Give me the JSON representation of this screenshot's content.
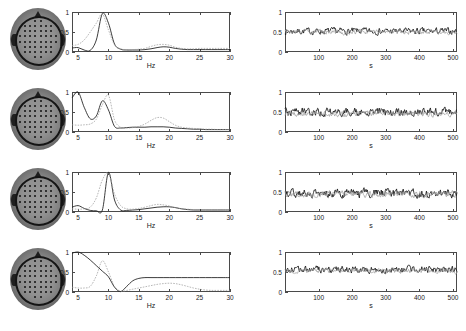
{
  "figure": {
    "rows": 4,
    "colors": {
      "line_primary": "#1a1a1a",
      "line_secondary": "#9a9a9a",
      "axis": "#4a4a4a",
      "head_dark": "#2a2a2a",
      "background": "#ffffff"
    }
  },
  "chart_data": [
    {
      "type": "line",
      "panel": "spectrum",
      "row": 1,
      "title": "",
      "xlabel": "Hz",
      "ylabel": "",
      "xlim": [
        4,
        30
      ],
      "ylim": [
        0,
        1
      ],
      "xticks": [
        5,
        10,
        15,
        20,
        25,
        30
      ],
      "yticks": [
        0,
        0.5,
        1
      ],
      "grid": false,
      "legend": "none",
      "x": [
        4,
        5,
        6,
        7,
        8,
        9,
        10,
        11,
        12,
        13,
        14,
        15,
        16,
        17,
        18,
        19,
        20,
        21,
        22,
        23,
        24,
        25,
        26,
        27,
        28,
        29,
        30
      ],
      "series": [
        {
          "name": "component-spectrum",
          "style": "solid-black",
          "values": [
            0.1,
            0.11,
            0.05,
            0.04,
            0.3,
            0.96,
            0.72,
            0.2,
            0.07,
            0.05,
            0.05,
            0.05,
            0.06,
            0.08,
            0.11,
            0.13,
            0.12,
            0.09,
            0.07,
            0.06,
            0.06,
            0.06,
            0.06,
            0.06,
            0.06,
            0.06,
            0.06
          ]
        },
        {
          "name": "reference-spectrum",
          "style": "dotted-gray",
          "values": [
            0.16,
            0.19,
            0.3,
            0.5,
            0.72,
            0.95,
            0.55,
            0.18,
            0.08,
            0.06,
            0.06,
            0.07,
            0.09,
            0.14,
            0.18,
            0.19,
            0.17,
            0.12,
            0.09,
            0.08,
            0.08,
            0.09,
            0.09,
            0.09,
            0.09,
            0.09,
            0.09
          ]
        }
      ]
    },
    {
      "type": "line",
      "panel": "timecourse",
      "row": 1,
      "title": "",
      "xlabel": "s",
      "ylabel": "",
      "xlim": [
        0,
        512
      ],
      "ylim": [
        0,
        1
      ],
      "xticks": [
        100,
        200,
        300,
        400,
        500
      ],
      "yticks": [
        0,
        0.5,
        1
      ],
      "grid": false,
      "legend": "none",
      "series": [
        {
          "name": "component-activity",
          "style": "solid-black",
          "mean": 0.52,
          "noise_amplitude": 0.09,
          "n_points": 512
        },
        {
          "name": "reference-activity",
          "style": "dotted-gray",
          "mean": 0.5,
          "noise_amplitude": 0.07,
          "n_points": 512
        }
      ]
    },
    {
      "type": "line",
      "panel": "spectrum",
      "row": 2,
      "title": "",
      "xlabel": "Hz",
      "ylabel": "",
      "xlim": [
        4,
        30
      ],
      "ylim": [
        0,
        1
      ],
      "xticks": [
        5,
        10,
        15,
        20,
        25,
        30
      ],
      "yticks": [
        0,
        0.5,
        1
      ],
      "grid": false,
      "legend": "none",
      "x": [
        4,
        5,
        6,
        7,
        8,
        9,
        10,
        11,
        12,
        13,
        14,
        15,
        16,
        17,
        18,
        19,
        20,
        21,
        22,
        23,
        24,
        25,
        26,
        27,
        28,
        29,
        30
      ],
      "series": [
        {
          "name": "component-spectrum",
          "style": "solid-black",
          "values": [
            0.85,
            1.0,
            0.62,
            0.33,
            0.4,
            0.78,
            0.55,
            0.14,
            0.1,
            0.11,
            0.12,
            0.12,
            0.12,
            0.13,
            0.13,
            0.13,
            0.12,
            0.1,
            0.09,
            0.08,
            0.07,
            0.07,
            0.06,
            0.06,
            0.06,
            0.06,
            0.06
          ]
        },
        {
          "name": "reference-spectrum",
          "style": "dotted-gray",
          "values": [
            0.18,
            0.17,
            0.18,
            0.2,
            0.32,
            0.68,
            0.92,
            0.3,
            0.12,
            0.1,
            0.11,
            0.14,
            0.2,
            0.29,
            0.36,
            0.35,
            0.26,
            0.17,
            0.12,
            0.1,
            0.09,
            0.08,
            0.07,
            0.07,
            0.06,
            0.06,
            0.06
          ]
        }
      ]
    },
    {
      "type": "line",
      "panel": "timecourse",
      "row": 2,
      "title": "",
      "xlabel": "s",
      "ylabel": "",
      "xlim": [
        0,
        512
      ],
      "ylim": [
        0,
        1
      ],
      "xticks": [
        100,
        200,
        300,
        400,
        500
      ],
      "yticks": [
        0,
        0.5,
        1
      ],
      "grid": false,
      "legend": "none",
      "series": [
        {
          "name": "component-activity",
          "style": "solid-black",
          "mean": 0.5,
          "noise_amplitude": 0.11,
          "n_points": 512
        },
        {
          "name": "reference-activity",
          "style": "dotted-gray",
          "mean": 0.46,
          "noise_amplitude": 0.08,
          "n_points": 512
        }
      ]
    },
    {
      "type": "line",
      "panel": "spectrum",
      "row": 3,
      "title": "",
      "xlabel": "Hz",
      "ylabel": "",
      "xlim": [
        4,
        30
      ],
      "ylim": [
        0,
        1
      ],
      "xticks": [
        5,
        10,
        15,
        20,
        25,
        30
      ],
      "yticks": [
        0,
        0.5,
        1
      ],
      "grid": false,
      "legend": "none",
      "x": [
        4,
        5,
        6,
        7,
        8,
        9,
        10,
        11,
        12,
        13,
        14,
        15,
        16,
        17,
        18,
        19,
        20,
        21,
        22,
        23,
        24,
        25,
        26,
        27,
        28,
        29,
        30
      ],
      "series": [
        {
          "name": "component-spectrum",
          "style": "solid-black",
          "values": [
            0.12,
            0.16,
            0.09,
            0.04,
            0.03,
            0.05,
            0.99,
            0.3,
            0.05,
            0.04,
            0.05,
            0.06,
            0.08,
            0.1,
            0.12,
            0.13,
            0.13,
            0.11,
            0.08,
            0.06,
            0.05,
            0.05,
            0.05,
            0.05,
            0.05,
            0.05,
            0.05
          ]
        },
        {
          "name": "reference-spectrum",
          "style": "dotted-gray",
          "values": [
            0.08,
            0.07,
            0.08,
            0.12,
            0.35,
            0.8,
            0.97,
            0.45,
            0.16,
            0.08,
            0.07,
            0.09,
            0.12,
            0.16,
            0.19,
            0.18,
            0.15,
            0.11,
            0.08,
            0.07,
            0.06,
            0.06,
            0.06,
            0.06,
            0.06,
            0.06,
            0.06
          ]
        }
      ]
    },
    {
      "type": "line",
      "panel": "timecourse",
      "row": 3,
      "title": "",
      "xlabel": "s",
      "ylabel": "",
      "xlim": [
        0,
        512
      ],
      "ylim": [
        0,
        1
      ],
      "xticks": [
        100,
        200,
        300,
        400,
        500
      ],
      "yticks": [
        0,
        0.5,
        1
      ],
      "grid": false,
      "legend": "none",
      "series": [
        {
          "name": "component-activity",
          "style": "solid-black",
          "mean": 0.47,
          "noise_amplitude": 0.12,
          "n_points": 512
        },
        {
          "name": "reference-activity",
          "style": "dotted-gray",
          "mean": 0.45,
          "noise_amplitude": 0.09,
          "n_points": 512
        }
      ]
    },
    {
      "type": "line",
      "panel": "spectrum",
      "row": 4,
      "title": "",
      "xlabel": "Hz",
      "ylabel": "",
      "xlim": [
        4,
        30
      ],
      "ylim": [
        0,
        1
      ],
      "xticks": [
        5,
        10,
        15,
        20,
        25,
        30
      ],
      "yticks": [
        0,
        0.5,
        1
      ],
      "grid": false,
      "legend": "none",
      "x": [
        4,
        5,
        6,
        7,
        8,
        9,
        10,
        11,
        12,
        13,
        14,
        15,
        16,
        17,
        18,
        19,
        20,
        21,
        22,
        23,
        24,
        25,
        26,
        27,
        28,
        29,
        30
      ],
      "series": [
        {
          "name": "component-spectrum",
          "style": "solid-black",
          "values": [
            0.97,
            1.0,
            0.92,
            0.8,
            0.66,
            0.52,
            0.38,
            0.12,
            0.01,
            0.14,
            0.28,
            0.34,
            0.36,
            0.36,
            0.36,
            0.36,
            0.36,
            0.36,
            0.36,
            0.36,
            0.36,
            0.36,
            0.36,
            0.36,
            0.36,
            0.36,
            0.36
          ]
        },
        {
          "name": "reference-spectrum",
          "style": "dotted-gray",
          "values": [
            0.12,
            0.1,
            0.1,
            0.14,
            0.4,
            0.78,
            0.5,
            0.14,
            0.02,
            0.04,
            0.07,
            0.1,
            0.13,
            0.16,
            0.19,
            0.21,
            0.22,
            0.21,
            0.18,
            0.14,
            0.1,
            0.07,
            0.05,
            0.04,
            0.04,
            0.04,
            0.04
          ]
        }
      ]
    },
    {
      "type": "line",
      "panel": "timecourse",
      "row": 4,
      "title": "",
      "xlabel": "s",
      "ylabel": "",
      "xlim": [
        0,
        512
      ],
      "ylim": [
        0,
        1
      ],
      "xticks": [
        100,
        200,
        300,
        400,
        500
      ],
      "yticks": [
        0,
        0.5,
        1
      ],
      "grid": false,
      "legend": "none",
      "series": [
        {
          "name": "component-activity",
          "style": "solid-black",
          "mean": 0.56,
          "noise_amplitude": 0.1,
          "n_points": 512
        },
        {
          "name": "reference-activity",
          "style": "dotted-gray",
          "mean": 0.53,
          "noise_amplitude": 0.07,
          "n_points": 512
        }
      ]
    }
  ],
  "axis_labels": {
    "spectrum_x": "Hz",
    "timecourse_x": "s",
    "yticks": [
      "0",
      "0.5",
      "1"
    ],
    "spectrum_xticks": [
      "5",
      "10",
      "15",
      "20",
      "25",
      "30"
    ],
    "timecourse_xticks": [
      "100",
      "200",
      "300",
      "400",
      "500"
    ]
  },
  "topomaps": [
    {
      "row": 1,
      "name": "scalp-topography-1",
      "electrode_count": 64
    },
    {
      "row": 2,
      "name": "scalp-topography-2",
      "electrode_count": 64
    },
    {
      "row": 3,
      "name": "scalp-topography-3",
      "electrode_count": 64
    },
    {
      "row": 4,
      "name": "scalp-topography-4",
      "electrode_count": 64
    }
  ]
}
